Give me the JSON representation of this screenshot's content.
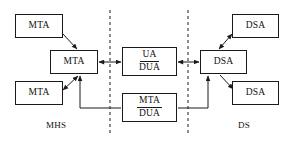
{
  "diagram": {
    "background_color": "#ffffff",
    "stroke_color": "#1a1a1a",
    "text_color": "#111111",
    "nodes": [
      {
        "id": "mta-top-left",
        "label": "MTA",
        "x": 15,
        "y": 14,
        "w": 48,
        "h": 24
      },
      {
        "id": "mta-center-left",
        "label": "MTA",
        "x": 50,
        "y": 50,
        "w": 48,
        "h": 24
      },
      {
        "id": "mta-bottom-left",
        "label": "MTA",
        "x": 15,
        "y": 81,
        "w": 48,
        "h": 24
      },
      {
        "id": "ua-dua",
        "label_top": "UA",
        "label_bottom": "DUA",
        "x": 122,
        "y": 47,
        "w": 55,
        "h": 29
      },
      {
        "id": "mta-dua",
        "label_top": "MTA",
        "label_bottom": "DUA",
        "x": 122,
        "y": 93,
        "w": 55,
        "h": 29
      },
      {
        "id": "dsa-center-right",
        "label": "DSA",
        "x": 200,
        "y": 50,
        "w": 47,
        "h": 24
      },
      {
        "id": "dsa-top-right",
        "label": "DSA",
        "x": 232,
        "y": 14,
        "w": 47,
        "h": 24
      },
      {
        "id": "dsa-bottom-right",
        "label": "DSA",
        "x": 232,
        "y": 81,
        "w": 47,
        "h": 24
      }
    ],
    "zones": [
      {
        "id": "mhs",
        "label": "MHS",
        "x": 46,
        "y": 120
      },
      {
        "id": "ds",
        "label": "DS",
        "x": 238,
        "y": 120
      }
    ],
    "boundaries": [
      {
        "id": "left-boundary",
        "x": 110,
        "y1": 10,
        "y2": 136
      },
      {
        "id": "right-boundary",
        "x": 188,
        "y1": 10,
        "y2": 136
      }
    ],
    "connections": [
      {
        "id": "mta-topleft-to-mta-center",
        "kind": "diagonal-arrow",
        "from": "mta-top-left",
        "to": "mta-center-left",
        "arrows": "single"
      },
      {
        "id": "mta-bottomleft-to-mta-center",
        "kind": "diagonal-arrow",
        "from": "mta-bottom-left",
        "to": "mta-center-left",
        "arrows": "double"
      },
      {
        "id": "mta-center-to-ua-dua",
        "kind": "horizontal-arrow",
        "from": "mta-center-left",
        "to": "ua-dua",
        "arrows": "double"
      },
      {
        "id": "ua-dua-to-dsa-center",
        "kind": "horizontal-arrow",
        "from": "ua-dua",
        "to": "dsa-center-right",
        "arrows": "double"
      },
      {
        "id": "dsa-center-to-dsa-topright",
        "kind": "diagonal-arrow",
        "from": "dsa-center-right",
        "to": "dsa-top-right",
        "arrows": "double"
      },
      {
        "id": "dsa-center-to-dsa-bottomright",
        "kind": "diagonal-arrow",
        "from": "dsa-center-right",
        "to": "dsa-bottom-right",
        "arrows": "single"
      },
      {
        "id": "mta-dua-to-mta-center",
        "kind": "routed-arrow",
        "from": "mta-dua",
        "to": "mta-center-left",
        "arrows": "single"
      },
      {
        "id": "mta-dua-to-dsa-center",
        "kind": "routed-arrow",
        "from": "mta-dua",
        "to": "dsa-center-right",
        "arrows": "single"
      }
    ]
  }
}
